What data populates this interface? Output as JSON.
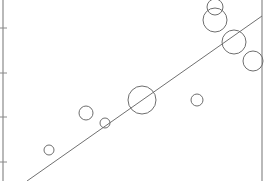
{
  "chart_data": {
    "type": "scatter",
    "subtype": "bubble",
    "title": "",
    "xlabel": "",
    "ylabel": "",
    "grid": false,
    "legend": null,
    "colors": {
      "axis": "#8a8a8a",
      "marker": "#6e6e6e",
      "trendline": "#707070",
      "background": "#ffffff"
    },
    "axis_px": {
      "left_x": 3,
      "right_x": 262,
      "top_y": 0,
      "bottom_y": 181,
      "y_ticks_px": [
        28,
        73,
        117,
        162
      ]
    },
    "points": [
      {
        "cx": 49,
        "cy": 150,
        "r": 5
      },
      {
        "cx": 86,
        "cy": 113,
        "r": 7
      },
      {
        "cx": 105,
        "cy": 123,
        "r": 5
      },
      {
        "cx": 142,
        "cy": 100,
        "r": 14
      },
      {
        "cx": 197,
        "cy": 100,
        "r": 6
      },
      {
        "cx": 215,
        "cy": 7,
        "r": 8
      },
      {
        "cx": 215,
        "cy": 20,
        "r": 12
      },
      {
        "cx": 234,
        "cy": 42,
        "r": 12
      },
      {
        "cx": 253,
        "cy": 61,
        "r": 10
      }
    ],
    "trendline": {
      "x1": 27,
      "y1": 181,
      "x2": 262,
      "y2": 16
    }
  }
}
